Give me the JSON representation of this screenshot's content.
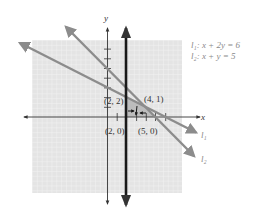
{
  "figure": {
    "axis_labels": {
      "x": "x",
      "y": "y"
    },
    "legend": [
      {
        "id": "l1",
        "text": "l₁: x + 2y = 6"
      },
      {
        "id": "l2",
        "text": "l₂: x + y = 5"
      }
    ],
    "line_labels": {
      "l1": "l₁",
      "l2": "l₂"
    },
    "points": [
      {
        "label": "(2, 2)",
        "x": 2,
        "y": 2
      },
      {
        "label": "(4, 1)",
        "x": 4,
        "y": 1
      },
      {
        "label": "(2, 0)",
        "x": 2,
        "y": 0
      },
      {
        "label": "(5, 0)",
        "x": 5,
        "y": 0
      }
    ],
    "vertical_line": {
      "equation": "x = 2"
    },
    "colors": {
      "grid_bg": "#e6e6e6",
      "grid_line": "#f7f7f7",
      "line_gray": "#8c8c8c",
      "axis": "#333333",
      "vertical_line": "#1a1a1a",
      "region": "#b0b0b0"
    }
  }
}
